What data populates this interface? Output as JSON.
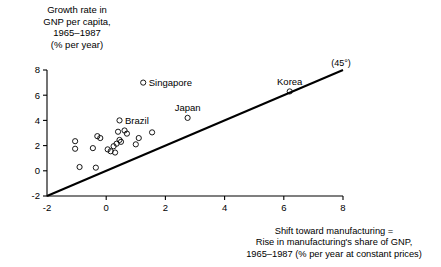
{
  "chart_data": {
    "type": "scatter",
    "title": "",
    "ylabel": "Growth rate in\nGNP per capita,\n1965–1987\n(% per year)",
    "xlabel": "Shift toward manufacturing  =\nRise in manufacturing's share of GNP,\n1965–1987 (% per year at constant prices)",
    "xlim": [
      -2,
      8
    ],
    "ylim": [
      -2,
      8
    ],
    "xticks": [
      -2,
      0,
      2,
      4,
      6,
      8
    ],
    "yticks": [
      -2,
      0,
      2,
      4,
      6,
      8
    ],
    "xtick_labels": [
      "-2",
      "0",
      "2",
      "4",
      "6",
      "8"
    ],
    "ytick_labels": [
      "-2",
      "0",
      "2",
      "4",
      "6",
      "8"
    ],
    "grid": false,
    "legend": false,
    "annotations": [
      {
        "text": "(45°)",
        "x": 7.6,
        "y": 8.35
      }
    ],
    "reference_line": {
      "label": "(45°)",
      "slope": 1,
      "intercept": 0,
      "from": [
        -2,
        -2
      ],
      "to": [
        8,
        8
      ]
    },
    "points": [
      {
        "label": "Singapore",
        "x": 1.25,
        "y": 7.0,
        "label_pos": "right"
      },
      {
        "label": "Korea",
        "x": 6.2,
        "y": 6.3,
        "label_pos": "above"
      },
      {
        "label": "Japan",
        "x": 2.75,
        "y": 4.2,
        "label_pos": "above"
      },
      {
        "label": "Brazil",
        "x": 0.45,
        "y": 4.0,
        "label_pos": "right"
      },
      {
        "label": "",
        "x": -1.05,
        "y": 2.35
      },
      {
        "label": "",
        "x": -1.05,
        "y": 1.75
      },
      {
        "label": "",
        "x": -0.3,
        "y": 2.75
      },
      {
        "label": "",
        "x": -0.2,
        "y": 2.6
      },
      {
        "label": "",
        "x": -0.45,
        "y": 1.8
      },
      {
        "label": "",
        "x": 0.05,
        "y": 1.7
      },
      {
        "label": "",
        "x": 0.25,
        "y": 1.95
      },
      {
        "label": "",
        "x": 0.35,
        "y": 2.15
      },
      {
        "label": "",
        "x": 0.45,
        "y": 2.45
      },
      {
        "label": "",
        "x": 0.5,
        "y": 2.3
      },
      {
        "label": "",
        "x": 0.4,
        "y": 3.1
      },
      {
        "label": "",
        "x": 0.62,
        "y": 3.2
      },
      {
        "label": "",
        "x": 0.7,
        "y": 2.95
      },
      {
        "label": "",
        "x": 0.3,
        "y": 1.45
      },
      {
        "label": "",
        "x": 0.15,
        "y": 1.55
      },
      {
        "label": "",
        "x": 1.0,
        "y": 2.1
      },
      {
        "label": "",
        "x": 1.1,
        "y": 2.6
      },
      {
        "label": "",
        "x": 1.55,
        "y": 3.05
      },
      {
        "label": "",
        "x": -0.9,
        "y": 0.3
      },
      {
        "label": "",
        "x": -0.35,
        "y": 0.25
      }
    ]
  }
}
